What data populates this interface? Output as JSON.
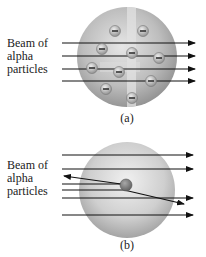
{
  "figure": {
    "panel_a": {
      "caption": "(a)",
      "label_lines": [
        "Beam of",
        "alpha",
        "particles"
      ],
      "model": "plum-pudding",
      "sphere": {
        "cx": 127,
        "cy": 57,
        "r": 50
      },
      "electron_symbol": "−",
      "electrons": [
        {
          "x": 115,
          "y": 31
        },
        {
          "x": 143,
          "y": 31
        },
        {
          "x": 102,
          "y": 49
        },
        {
          "x": 132,
          "y": 53
        },
        {
          "x": 159,
          "y": 58
        },
        {
          "x": 92,
          "y": 68
        },
        {
          "x": 119,
          "y": 72
        },
        {
          "x": 151,
          "y": 81
        },
        {
          "x": 106,
          "y": 89
        },
        {
          "x": 132,
          "y": 98
        }
      ],
      "beams_y": [
        43,
        56,
        69,
        81
      ]
    },
    "panel_b": {
      "caption": "(b)",
      "label_lines": [
        "Beam of",
        "alpha",
        "particles"
      ],
      "model": "nuclear",
      "sphere": {
        "cx": 127,
        "cy": 190,
        "r": 48
      },
      "nucleus": {
        "x": 126,
        "y": 185,
        "r": 6
      },
      "beams_straight_y": [
        155,
        169,
        198,
        215
      ],
      "beam_reflected": {
        "in_y": 184,
        "back_to": {
          "x": 63,
          "y": 176
        }
      },
      "beam_deflected": {
        "in_y": 190,
        "out_to": {
          "x": 185,
          "y": 204
        }
      }
    },
    "colors": {
      "sphere_light": "#e8e8e8",
      "sphere_dark": "#8a8a8a",
      "arrow": "#111111",
      "nucleus": "#7a7a7a"
    }
  }
}
